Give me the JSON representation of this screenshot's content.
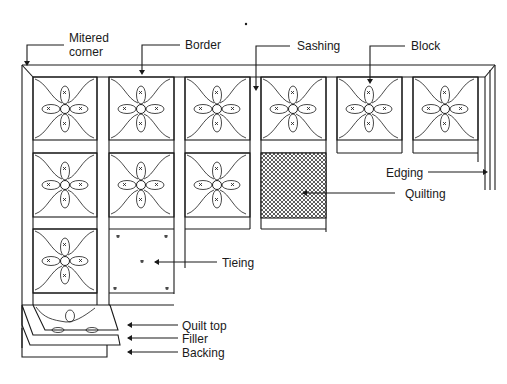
{
  "diagram": {
    "labels": {
      "mitered_corner_line1": "Mitered",
      "mitered_corner_line2": "corner",
      "border": "Border",
      "sashing": "Sashing",
      "block": "Block",
      "edging": "Edging",
      "quilting": "Quilting",
      "tieing": "Tieing",
      "quilt_top": "Quilt top",
      "filler": "Filler",
      "backing": "Backing"
    },
    "layout": {
      "columns": 6,
      "row1_blocks": 6,
      "row2_blocks": 3,
      "row2_quilted_block_column": 4,
      "row3_blocks": 1,
      "row3_tied_block_column": 2
    },
    "colors": {
      "line": "#1a1a1a",
      "background": "#ffffff"
    }
  }
}
